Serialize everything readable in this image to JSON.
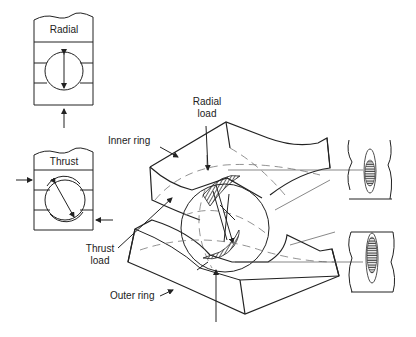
{
  "figure": {
    "insets": {
      "radial": {
        "label": "Radial"
      },
      "thrust": {
        "label": "Thrust"
      }
    },
    "labels": {
      "radial_load_line1": "Radial",
      "radial_load_line2": "load",
      "inner_ring": "Inner ring",
      "thrust_load_line1": "Thrust",
      "thrust_load_line2": "load",
      "outer_ring": "Outer ring"
    },
    "contact_patches": [
      "upper-contact-ellipse",
      "lower-contact-ellipse"
    ],
    "colors": {
      "line": "#222222",
      "background": "#ffffff",
      "hatch": "#333333"
    }
  }
}
